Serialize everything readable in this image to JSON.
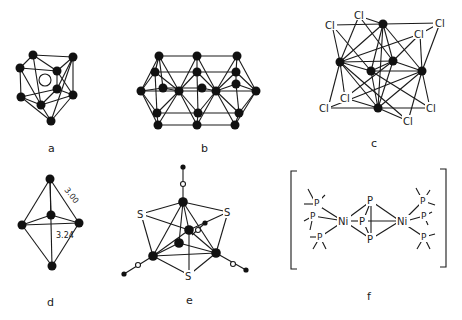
{
  "figure": {
    "panels": [
      {
        "id": "a",
        "caption": "a",
        "description": "cluster with central hollow atom (vacancy)"
      },
      {
        "id": "b",
        "caption": "b",
        "description": "fused octahedral metal chain cluster"
      },
      {
        "id": "c",
        "caption": "c",
        "description": "metal octahedron with bridging chlorides",
        "atom_labels": [
          "Cl",
          "Cl",
          "Cl",
          "Cl",
          "Cl",
          "Cl",
          "Cl",
          "Cl",
          "Cl"
        ]
      },
      {
        "id": "d",
        "caption": "d",
        "description": "trigonal bipyramid with bond distances",
        "distances": [
          "3.00",
          "3.24"
        ]
      },
      {
        "id": "e",
        "caption": "e",
        "description": "metal cluster with capping sulfur atoms and carbonyl ligands",
        "atom_labels": [
          "S",
          "S",
          "S"
        ]
      },
      {
        "id": "f",
        "caption": "f",
        "description": "dinickel complex with P3 bridge and phosphine ligands",
        "atom_labels": [
          "Ni",
          "Ni",
          "P",
          "P",
          "P",
          "P"
        ]
      }
    ]
  }
}
